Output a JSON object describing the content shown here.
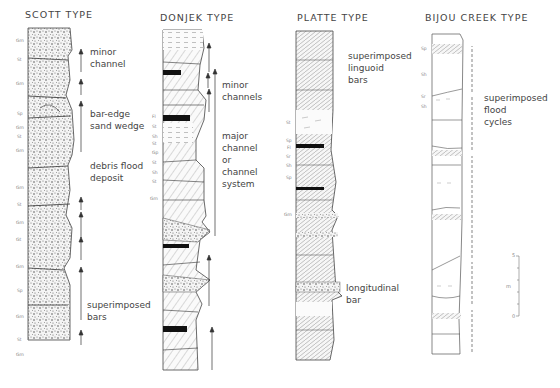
{
  "figure": {
    "columns": [
      {
        "id": "scott",
        "title": "SCOTT TYPE",
        "lithology": "gravel-dominated (massive gravel with minor sand lenses)",
        "facies_codes": [
          "Gm",
          "St",
          "Gm",
          "Sp",
          "Gm",
          "St",
          "Gm",
          "Gm",
          "St",
          "Gm",
          "Gt",
          "Gm",
          "Sp",
          "Gm",
          "St",
          "Gm"
        ],
        "annotations": [
          {
            "text": "minor\nchannel"
          },
          {
            "text": "bar-edge\nsand wedge"
          },
          {
            "text": "debris flood\ndeposit"
          },
          {
            "text": "superimposed\nbars"
          }
        ]
      },
      {
        "id": "donjek",
        "title": "DONJEK TYPE",
        "lithology": "cyclic gravel and cross-bedded sand with fines (black) caps",
        "facies_codes": [
          "Fl",
          "St",
          "Sh",
          "St",
          "Gp",
          "St",
          "Sh",
          "St",
          "Gm"
        ],
        "annotations": [
          {
            "text": "minor\nchannels"
          },
          {
            "text": "major\nchannel\nor\nchannel\nsystem"
          }
        ]
      },
      {
        "id": "platte",
        "title": "PLATTE TYPE",
        "lithology": "sand-dominated planar cross-bedded units",
        "facies_codes": [
          "St",
          "Sp",
          "Fl",
          "Sr",
          "Sh",
          "Sp",
          "Gm"
        ],
        "annotations": [
          {
            "text": "superimposed\nlinguoid\nbars"
          },
          {
            "text": "longitudinal\nbar"
          }
        ]
      },
      {
        "id": "bijou",
        "title": "BIJOU CREEK TYPE",
        "lithology": "horizontally laminated sand flood units",
        "facies_codes": [
          "Sp",
          "Sh",
          "Sr",
          "Sh"
        ],
        "annotations": [
          {
            "text": "superimposed\nflood\ncycles"
          }
        ]
      }
    ],
    "scale_bar": {
      "top_label": "5",
      "bottom_label": "0",
      "unit": "m"
    }
  }
}
